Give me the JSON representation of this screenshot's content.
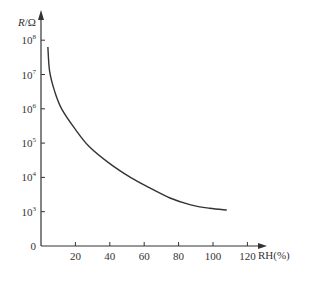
{
  "chart_data": {
    "type": "line",
    "title": "",
    "xlabel": "RH(%)",
    "ylabel": "R/Ω",
    "ylabel_italic_part": "R",
    "yscale": "log",
    "xlim": [
      0,
      125
    ],
    "ylim_log10": [
      2,
      8
    ],
    "x_ticks": [
      20,
      40,
      60,
      80,
      100,
      120
    ],
    "y_ticks": [
      {
        "label": "0",
        "exp": null
      },
      {
        "label": "10",
        "exp": "3"
      },
      {
        "label": "10",
        "exp": "4"
      },
      {
        "label": "10",
        "exp": "5"
      },
      {
        "label": "10",
        "exp": "6"
      },
      {
        "label": "10",
        "exp": "7"
      },
      {
        "label": "10",
        "exp": "8"
      }
    ],
    "grid": false,
    "legend": null,
    "series": [
      {
        "name": "R vs RH",
        "x": [
          4,
          5,
          8,
          12,
          20,
          28,
          40,
          52,
          63,
          75,
          87,
          98,
          108
        ],
        "log10_y": [
          7.8,
          7.1,
          6.5,
          6.0,
          5.4,
          4.9,
          4.4,
          4.0,
          3.7,
          3.4,
          3.2,
          3.1,
          3.05
        ]
      }
    ],
    "color": "#333333"
  }
}
